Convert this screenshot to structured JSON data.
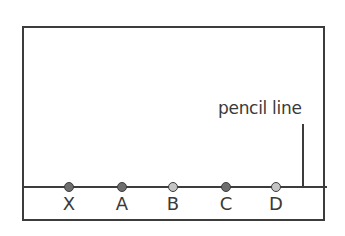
{
  "diagram": {
    "type": "chromatography_setup",
    "caption": "pencil line",
    "colors": {
      "dark_spot": "#6e6e6e",
      "light_spot": "#c4c4c4",
      "outline": "#3c3c3c"
    },
    "spots": [
      {
        "label": "X",
        "shade": "dark"
      },
      {
        "label": "A",
        "shade": "dark"
      },
      {
        "label": "B",
        "shade": "light"
      },
      {
        "label": "C",
        "shade": "dark"
      },
      {
        "label": "D",
        "shade": "light"
      }
    ]
  }
}
